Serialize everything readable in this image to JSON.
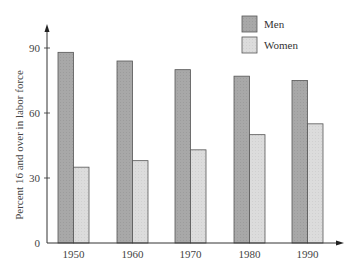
{
  "chart_data": {
    "type": "bar",
    "title": "",
    "xlabel": "",
    "ylabel": "Percent 16 and over in labor force",
    "categories": [
      "1950",
      "1960",
      "1970",
      "1980",
      "1990"
    ],
    "series": [
      {
        "name": "Men",
        "color": "#a9a9a9",
        "values": [
          88,
          84,
          80,
          77,
          75
        ]
      },
      {
        "name": "Women",
        "color": "#dcdcdc",
        "values": [
          35,
          38,
          43,
          50,
          55
        ]
      }
    ],
    "yticks": [
      "0",
      "30",
      "60",
      "90"
    ],
    "ylim": [
      0,
      100
    ],
    "grid": false,
    "legend_position": "top-right"
  }
}
